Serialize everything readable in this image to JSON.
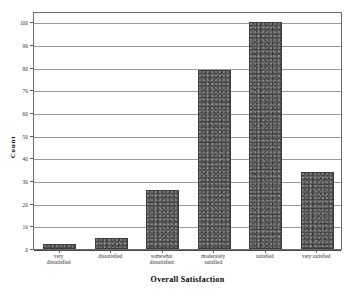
{
  "chart_data": {
    "type": "bar",
    "title": "",
    "categories": [
      "very dissatisfied",
      "dissatisfied",
      "somewhat dissatisfied",
      "moderately satisfied",
      "satisfied",
      "very satisfied"
    ],
    "category_lines": [
      [
        "very",
        "dissatisfied"
      ],
      [
        "dissatisfied"
      ],
      [
        "somewhat",
        "dissatisfied"
      ],
      [
        "moderately",
        "satisfied"
      ],
      [
        "satisfied"
      ],
      [
        "very satisfied"
      ]
    ],
    "values": [
      2,
      5,
      26,
      79,
      100,
      34
    ],
    "xlabel": "Overall Satisfaction",
    "ylabel": "Count",
    "ylim": [
      0,
      105
    ],
    "yticks": [
      0,
      10,
      20,
      30,
      40,
      50,
      60,
      70,
      80,
      90,
      100
    ],
    "ytick_labels": [
      "0",
      "10",
      "20",
      "30",
      "40",
      "50",
      "60",
      "70",
      "80",
      "90",
      "100"
    ],
    "grid": true,
    "legend": "none",
    "bar_color": "#5b5b5b",
    "bar_border_color": "#3d3d3d",
    "grid_color": "#9a9a9a",
    "frame_color": "#6b6b6b",
    "background": "#ffffff"
  }
}
